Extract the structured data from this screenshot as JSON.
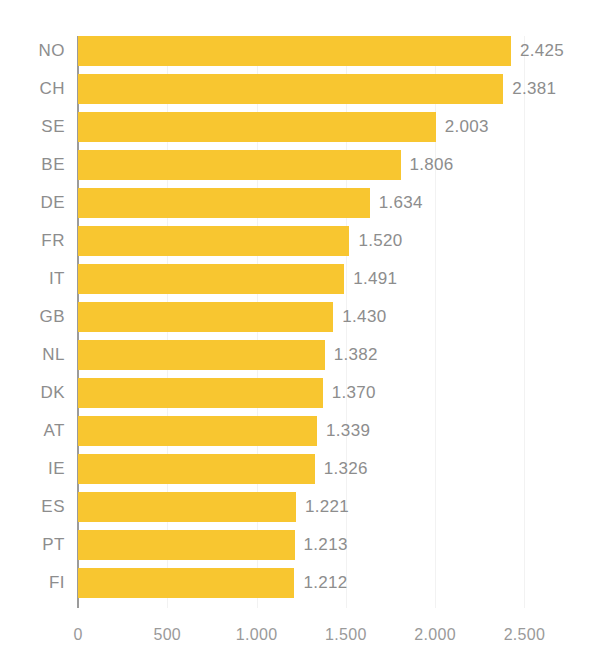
{
  "chart_data": {
    "type": "bar",
    "orientation": "horizontal",
    "title": "",
    "subtitle": "",
    "xlabel": "",
    "ylabel": "",
    "categories": [
      "NO",
      "CH",
      "SE",
      "BE",
      "DE",
      "FR",
      "IT",
      "GB",
      "NL",
      "DK",
      "AT",
      "IE",
      "ES",
      "PT",
      "FI"
    ],
    "values": [
      2425,
      2381,
      2003,
      1806,
      1634,
      1520,
      1491,
      1430,
      1382,
      1370,
      1339,
      1326,
      1221,
      1213,
      1212
    ],
    "value_labels": [
      "2.425",
      "2.381",
      "2.003",
      "1.806",
      "1.634",
      "1.520",
      "1.491",
      "1.430",
      "1.382",
      "1.370",
      "1.339",
      "1.326",
      "1.221",
      "1.213",
      "1.212"
    ],
    "bars": [
      {
        "category": "NO",
        "value": 2425,
        "label": "2.425"
      },
      {
        "category": "CH",
        "value": 2381,
        "label": "2.381"
      },
      {
        "category": "SE",
        "value": 2003,
        "label": "2.003"
      },
      {
        "category": "BE",
        "value": 1806,
        "label": "1.806"
      },
      {
        "category": "DE",
        "value": 1634,
        "label": "1.634"
      },
      {
        "category": "FR",
        "value": 1520,
        "label": "1.520"
      },
      {
        "category": "IT",
        "value": 1491,
        "label": "1.491"
      },
      {
        "category": "GB",
        "value": 1430,
        "label": "1.430"
      },
      {
        "category": "NL",
        "value": 1382,
        "label": "1.382"
      },
      {
        "category": "DK",
        "value": 1370,
        "label": "1.370"
      },
      {
        "category": "AT",
        "value": 1339,
        "label": "1.339"
      },
      {
        "category": "IE",
        "value": 1326,
        "label": "1.326"
      },
      {
        "category": "ES",
        "value": 1221,
        "label": "1.221"
      },
      {
        "category": "PT",
        "value": 1213,
        "label": "1.213"
      },
      {
        "category": "FI",
        "value": 1212,
        "label": "1.212"
      }
    ],
    "xlim": [
      0,
      2800
    ],
    "xticks": [
      0,
      500,
      1000,
      1500,
      2000,
      2500
    ],
    "xtick_labels": [
      "0",
      "500",
      "1.000",
      "1.500",
      "2.000",
      "2.500"
    ],
    "grid": "vertical-faint",
    "legend": null,
    "colors": {
      "bar": "#f8c630",
      "axis_line": "#9b9b9b",
      "gridline": "#f2f2f2",
      "label_text": "#8d8d8d",
      "tick_text": "#9a9a9a",
      "background": "#ffffff"
    }
  }
}
